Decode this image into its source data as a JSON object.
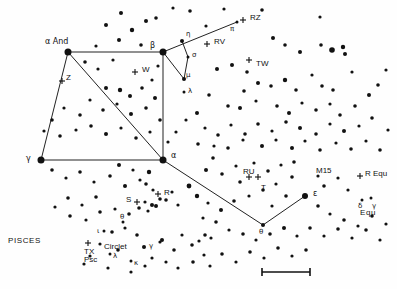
{
  "chart_data": {
    "type": "scatter",
    "title": "PISCES",
    "subtitle": "Great Square of Pegasus and surrounding field",
    "xlabel": "",
    "ylabel": "",
    "xlim": [
      0,
      397
    ],
    "ylim": [
      0,
      289
    ],
    "grid": false,
    "legend": "none",
    "background_color": "#fefefe",
    "star_color": "#111111",
    "line_color": "#222222",
    "constellation_lines": [
      {
        "name": "pegasus-square-top",
        "points": [
          [
            68,
            52
          ],
          [
            163,
            160
          ]
        ]
      },
      {
        "name": "square-left",
        "points": [
          [
            68,
            52
          ],
          [
            41,
            160
          ]
        ]
      },
      {
        "name": "square-bottom",
        "points": [
          [
            41,
            160
          ],
          [
            163,
            160
          ]
        ]
      },
      {
        "name": "square-right",
        "points": [
          [
            163,
            52
          ],
          [
            163,
            160
          ]
        ]
      },
      {
        "name": "square-top-edge",
        "points": [
          [
            68,
            52
          ],
          [
            163,
            52
          ]
        ]
      },
      {
        "name": "beta-to-pi",
        "points": [
          [
            163,
            52
          ],
          [
            237,
            22
          ]
        ]
      },
      {
        "name": "beta-to-mu",
        "points": [
          [
            163,
            52
          ],
          [
            184,
            79
          ]
        ]
      },
      {
        "name": "eta-to-sigma-to-mu",
        "points": [
          [
            182,
            41
          ],
          [
            188,
            57
          ],
          [
            184,
            79
          ]
        ]
      },
      {
        "name": "alpha-peg-to-theta",
        "points": [
          [
            163,
            160
          ],
          [
            263,
            225
          ]
        ]
      },
      {
        "name": "theta-to-epsilon",
        "points": [
          [
            263,
            225
          ],
          [
            305,
            196
          ]
        ]
      }
    ],
    "labeled_stars": [
      {
        "label": "α And",
        "x": 68,
        "y": 52,
        "mag": 1,
        "lx": 45,
        "ly": 38,
        "size": 7
      },
      {
        "label": "β",
        "x": 163,
        "y": 52,
        "mag": 1,
        "lx": 150,
        "ly": 42,
        "size": 7
      },
      {
        "label": "γ",
        "x": 41,
        "y": 160,
        "mag": 1,
        "lx": 26,
        "ly": 155,
        "size": 7
      },
      {
        "label": "α",
        "x": 163,
        "y": 160,
        "mag": 1,
        "lx": 171,
        "ly": 152,
        "size": 7
      },
      {
        "label": "ε",
        "x": 305,
        "y": 196,
        "mag": 2,
        "lx": 313,
        "ly": 190,
        "size": 6
      },
      {
        "label": "θ",
        "x": 263,
        "y": 225,
        "mag": 3,
        "lx": 259,
        "ly": 229,
        "size": 4
      },
      {
        "label": "η",
        "x": 182,
        "y": 41,
        "mag": 3,
        "lx": 186,
        "ly": 31,
        "size": 4
      },
      {
        "label": "σ",
        "x": 188,
        "y": 57,
        "mag": 4,
        "lx": 192,
        "ly": 52,
        "size": 3
      },
      {
        "label": "μ",
        "x": 184,
        "y": 79,
        "mag": 3,
        "lx": 186,
        "ly": 72,
        "size": 4
      },
      {
        "label": "λ",
        "x": 184,
        "y": 92,
        "mag": 4,
        "lx": 188,
        "ly": 88,
        "size": 3
      },
      {
        "label": "π",
        "x": 237,
        "y": 22,
        "mag": 4,
        "lx": 230,
        "ly": 26,
        "size": 3
      },
      {
        "label": "γ",
        "x": 144,
        "y": 247,
        "mag": 3,
        "lx": 149,
        "ly": 243,
        "size": 4
      },
      {
        "label": "λ",
        "x": 110,
        "y": 254,
        "mag": 4,
        "lx": 113,
        "ly": 253,
        "size": 3
      },
      {
        "label": "κ",
        "x": 131,
        "y": 261,
        "mag": 4,
        "lx": 134,
        "ly": 260,
        "size": 3
      },
      {
        "label": "θ",
        "x": 123,
        "y": 222,
        "mag": 4,
        "lx": 120,
        "ly": 214,
        "size": 3
      },
      {
        "label": "ι",
        "x": 104,
        "y": 231,
        "mag": 4,
        "lx": 97,
        "ly": 228,
        "size": 3
      },
      {
        "label": "δ",
        "x": 362,
        "y": 200,
        "mag": 4,
        "lx": 358,
        "ly": 203,
        "size": 3
      },
      {
        "label": "γ",
        "x": 371,
        "y": 198,
        "mag": 4,
        "lx": 372,
        "ly": 203,
        "size": 3
      }
    ],
    "variable_star_markers": [
      {
        "label": "RZ",
        "x": 243,
        "y": 20,
        "lx": 250,
        "ly": 14
      },
      {
        "label": "RV",
        "x": 207,
        "y": 44,
        "lx": 214,
        "ly": 38
      },
      {
        "label": "TW",
        "x": 249,
        "y": 60,
        "lx": 256,
        "ly": 60
      },
      {
        "label": "W",
        "x": 135,
        "y": 72,
        "lx": 142,
        "ly": 66
      },
      {
        "label": "Z",
        "x": 62,
        "y": 81,
        "lx": 66,
        "ly": 74
      },
      {
        "label": "R",
        "x": 158,
        "y": 194,
        "lx": 164,
        "ly": 189
      },
      {
        "label": "S",
        "x": 137,
        "y": 202,
        "lx": 126,
        "ly": 196
      },
      {
        "label": "RU",
        "x": 249,
        "y": 177,
        "lx": 243,
        "ly": 168
      },
      {
        "label": "T",
        "x": 258,
        "y": 177,
        "lx": 261,
        "ly": 184
      },
      {
        "label": "R Equ",
        "x": 360,
        "y": 176,
        "lx": 365,
        "ly": 170
      },
      {
        "label": "TX\nPsc",
        "x": 88,
        "y": 243,
        "lx": 84,
        "ly": 248
      }
    ],
    "text_annotations": [
      {
        "text": "PISCES",
        "x": 8,
        "y": 237,
        "size": 8,
        "style": "constellation"
      },
      {
        "text": "Circlet",
        "x": 104,
        "y": 243,
        "size": 8,
        "style": "asterism"
      },
      {
        "text": "M15",
        "x": 316,
        "y": 167,
        "size": 8,
        "style": "object"
      },
      {
        "text": "Equ",
        "x": 360,
        "y": 209,
        "size": 8,
        "style": "constellation"
      }
    ],
    "field_stars": [
      [
        121,
        13,
        2.0
      ],
      [
        156,
        18,
        1.8
      ],
      [
        173,
        8,
        1.6
      ],
      [
        190,
        11,
        1.8
      ],
      [
        106,
        25,
        2.0
      ],
      [
        132,
        30,
        2.2
      ],
      [
        146,
        21,
        2.0
      ],
      [
        119,
        40,
        2.0
      ],
      [
        96,
        46,
        1.6
      ],
      [
        141,
        45,
        1.8
      ],
      [
        206,
        26,
        1.6
      ],
      [
        224,
        9,
        1.6
      ],
      [
        262,
        10,
        1.8
      ],
      [
        273,
        38,
        2.0
      ],
      [
        285,
        45,
        1.8
      ],
      [
        300,
        52,
        2.0
      ],
      [
        320,
        17,
        1.6
      ],
      [
        332,
        50,
        2.8
      ],
      [
        343,
        47,
        2.2
      ],
      [
        345,
        54,
        2.0
      ],
      [
        321,
        45,
        1.8
      ],
      [
        312,
        75,
        1.6
      ],
      [
        322,
        86,
        1.8
      ],
      [
        333,
        90,
        1.8
      ],
      [
        352,
        72,
        1.6
      ],
      [
        247,
        72,
        1.8
      ],
      [
        258,
        83,
        2.0
      ],
      [
        271,
        86,
        1.8
      ],
      [
        285,
        80,
        2.2
      ],
      [
        296,
        90,
        1.8
      ],
      [
        244,
        91,
        1.8
      ],
      [
        232,
        65,
        2.0
      ],
      [
        217,
        69,
        2.0
      ],
      [
        209,
        95,
        1.8
      ],
      [
        228,
        106,
        1.8
      ],
      [
        240,
        108,
        2.0
      ],
      [
        256,
        101,
        1.6
      ],
      [
        277,
        106,
        1.8
      ],
      [
        289,
        113,
        2.0
      ],
      [
        302,
        103,
        1.6
      ],
      [
        316,
        110,
        1.8
      ],
      [
        330,
        104,
        1.6
      ],
      [
        340,
        115,
        1.8
      ],
      [
        355,
        106,
        1.8
      ],
      [
        369,
        95,
        2.0
      ],
      [
        378,
        85,
        1.8
      ],
      [
        386,
        70,
        1.6
      ],
      [
        372,
        118,
        1.8
      ],
      [
        359,
        126,
        1.6
      ],
      [
        344,
        131,
        2.0
      ],
      [
        330,
        124,
        1.6
      ],
      [
        316,
        134,
        1.8
      ],
      [
        300,
        128,
        2.0
      ],
      [
        286,
        122,
        1.8
      ],
      [
        272,
        131,
        1.6
      ],
      [
        258,
        124,
        1.8
      ],
      [
        245,
        134,
        1.8
      ],
      [
        231,
        125,
        1.6
      ],
      [
        218,
        135,
        1.8
      ],
      [
        205,
        128,
        1.6
      ],
      [
        197,
        113,
        2.0
      ],
      [
        186,
        120,
        1.6
      ],
      [
        176,
        132,
        1.6
      ],
      [
        198,
        144,
        1.8
      ],
      [
        214,
        146,
        1.6
      ],
      [
        228,
        148,
        1.8
      ],
      [
        243,
        140,
        1.6
      ],
      [
        262,
        146,
        2.0
      ],
      [
        276,
        140,
        1.6
      ],
      [
        292,
        148,
        2.0
      ],
      [
        305,
        141,
        1.6
      ],
      [
        320,
        150,
        1.8
      ],
      [
        336,
        143,
        1.6
      ],
      [
        351,
        149,
        1.8
      ],
      [
        366,
        141,
        1.6
      ],
      [
        380,
        150,
        1.8
      ],
      [
        388,
        130,
        1.6
      ],
      [
        85,
        62,
        1.8
      ],
      [
        113,
        60,
        1.6
      ],
      [
        98,
        69,
        1.6
      ],
      [
        106,
        88,
        2.0
      ],
      [
        120,
        90,
        2.2
      ],
      [
        130,
        96,
        2.0
      ],
      [
        142,
        88,
        1.8
      ],
      [
        152,
        80,
        1.6
      ],
      [
        158,
        66,
        1.6
      ],
      [
        90,
        100,
        1.6
      ],
      [
        103,
        110,
        1.8
      ],
      [
        117,
        104,
        1.6
      ],
      [
        131,
        114,
        2.0
      ],
      [
        146,
        108,
        1.8
      ],
      [
        155,
        98,
        2.0
      ],
      [
        80,
        115,
        1.8
      ],
      [
        64,
        108,
        1.6
      ],
      [
        52,
        120,
        1.8
      ],
      [
        44,
        131,
        1.6
      ],
      [
        60,
        136,
        1.8
      ],
      [
        76,
        130,
        1.6
      ],
      [
        91,
        126,
        1.8
      ],
      [
        106,
        134,
        2.0
      ],
      [
        121,
        128,
        1.6
      ],
      [
        136,
        138,
        1.8
      ],
      [
        150,
        132,
        1.6
      ],
      [
        160,
        120,
        1.8
      ],
      [
        168,
        142,
        1.6
      ],
      [
        52,
        170,
        1.8
      ],
      [
        66,
        178,
        1.6
      ],
      [
        80,
        172,
        1.8
      ],
      [
        94,
        182,
        1.6
      ],
      [
        110,
        176,
        1.8
      ],
      [
        125,
        186,
        2.0
      ],
      [
        140,
        180,
        1.6
      ],
      [
        149,
        172,
        2.2
      ],
      [
        119,
        165,
        2.0
      ],
      [
        133,
        170,
        1.6
      ],
      [
        146,
        184,
        1.8
      ],
      [
        153,
        190,
        1.6
      ],
      [
        160,
        199,
        1.8
      ],
      [
        152,
        205,
        2.0
      ],
      [
        145,
        202,
        1.6
      ],
      [
        139,
        208,
        1.8
      ],
      [
        148,
        211,
        1.6
      ],
      [
        156,
        206,
        2.0
      ],
      [
        166,
        200,
        1.8
      ],
      [
        172,
        192,
        1.6
      ],
      [
        178,
        205,
        1.6
      ],
      [
        96,
        197,
        1.8
      ],
      [
        82,
        205,
        1.6
      ],
      [
        68,
        198,
        1.8
      ],
      [
        55,
        207,
        1.6
      ],
      [
        70,
        216,
        1.8
      ],
      [
        86,
        220,
        1.6
      ],
      [
        100,
        212,
        1.8
      ],
      [
        115,
        209,
        1.6
      ],
      [
        129,
        214,
        1.8
      ],
      [
        112,
        232,
        1.8
      ],
      [
        125,
        228,
        1.6
      ],
      [
        137,
        235,
        1.8
      ],
      [
        100,
        244,
        1.6
      ],
      [
        90,
        256,
        1.6
      ],
      [
        118,
        250,
        1.8
      ],
      [
        152,
        258,
        1.6
      ],
      [
        162,
        240,
        2.0
      ],
      [
        174,
        250,
        1.8
      ],
      [
        166,
        262,
        1.6
      ],
      [
        182,
        235,
        1.6
      ],
      [
        192,
        245,
        1.8
      ],
      [
        204,
        255,
        1.6
      ],
      [
        193,
        262,
        1.8
      ],
      [
        178,
        268,
        1.6
      ],
      [
        213,
        158,
        1.8
      ],
      [
        206,
        170,
        2.0
      ],
      [
        222,
        174,
        1.8
      ],
      [
        236,
        166,
        1.6
      ],
      [
        240,
        182,
        1.8
      ],
      [
        254,
        163,
        1.6
      ],
      [
        268,
        171,
        1.8
      ],
      [
        281,
        165,
        1.6
      ],
      [
        292,
        177,
        1.8
      ],
      [
        276,
        184,
        1.6
      ],
      [
        263,
        190,
        1.8
      ],
      [
        249,
        196,
        1.6
      ],
      [
        234,
        201,
        1.8
      ],
      [
        221,
        210,
        2.0
      ],
      [
        208,
        203,
        1.6
      ],
      [
        197,
        196,
        2.2
      ],
      [
        189,
        186,
        2.4
      ],
      [
        203,
        218,
        1.6
      ],
      [
        216,
        222,
        1.8
      ],
      [
        229,
        230,
        1.6
      ],
      [
        243,
        234,
        1.8
      ],
      [
        256,
        240,
        1.6
      ],
      [
        270,
        234,
        1.8
      ],
      [
        284,
        228,
        2.0
      ],
      [
        297,
        236,
        1.6
      ],
      [
        310,
        228,
        1.8
      ],
      [
        324,
        236,
        1.6
      ],
      [
        338,
        229,
        1.8
      ],
      [
        352,
        238,
        1.6
      ],
      [
        366,
        230,
        1.8
      ],
      [
        380,
        240,
        1.6
      ],
      [
        306,
        250,
        1.8
      ],
      [
        292,
        256,
        1.6
      ],
      [
        278,
        248,
        1.8
      ],
      [
        264,
        258,
        1.6
      ],
      [
        250,
        252,
        1.8
      ],
      [
        236,
        262,
        1.6
      ],
      [
        222,
        254,
        1.8
      ],
      [
        210,
        266,
        1.6
      ],
      [
        330,
        214,
        1.6
      ],
      [
        344,
        220,
        1.8
      ],
      [
        358,
        226,
        1.6
      ],
      [
        372,
        216,
        1.8
      ],
      [
        386,
        224,
        1.6
      ],
      [
        318,
        206,
        1.8
      ],
      [
        205,
        235,
        1.8
      ],
      [
        211,
        238,
        1.6
      ],
      [
        199,
        241,
        1.6
      ],
      [
        324,
        186,
        1.8
      ],
      [
        338,
        178,
        1.6
      ],
      [
        294,
        162,
        1.8
      ],
      [
        318,
        176,
        1.6
      ],
      [
        348,
        190,
        1.6
      ],
      [
        286,
        196,
        1.8
      ],
      [
        272,
        206,
        1.6
      ],
      [
        160,
        242,
        1.6
      ],
      [
        145,
        266,
        1.6
      ],
      [
        131,
        272,
        1.6
      ],
      [
        108,
        268,
        1.6
      ],
      [
        84,
        264,
        1.6
      ]
    ],
    "scale_bar": {
      "x1": 262,
      "x2": 310,
      "y": 272,
      "cap_height": 8
    }
  }
}
